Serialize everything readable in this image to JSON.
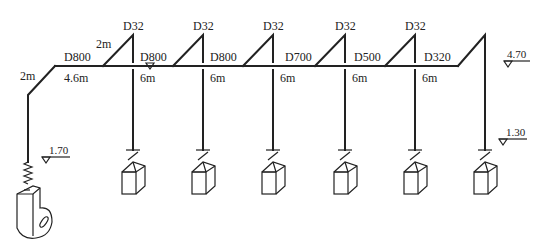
{
  "diagram": {
    "type": "duct-system-isometric",
    "stroke_color": "#222222",
    "background": "#ffffff",
    "main_duct": {
      "segments": [
        {
          "label": "D800",
          "length": "4.6m"
        },
        {
          "label": "D800",
          "length": "6m"
        },
        {
          "label": "D800",
          "length": "6m"
        },
        {
          "label": "D700",
          "length": "6m"
        },
        {
          "label": "D500",
          "length": "6m"
        },
        {
          "label": "D320",
          "length": "6m"
        }
      ],
      "riser_length": "2m",
      "first_branch_rise": "2m"
    },
    "branches": [
      {
        "label": "D32"
      },
      {
        "label": "D32"
      },
      {
        "label": "D32"
      },
      {
        "label": "D32"
      },
      {
        "label": "D32"
      }
    ],
    "elevations": {
      "main_duct": "4.70",
      "fan_inlet": "1.70",
      "terminal": "1.30"
    },
    "equipment": {
      "fan": "centrifugal-fan",
      "terminals": 6
    }
  }
}
